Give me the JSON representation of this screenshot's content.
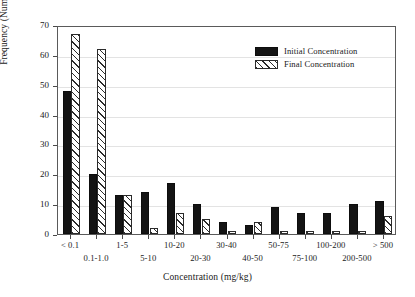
{
  "chart_data": {
    "type": "bar",
    "title": "",
    "subtitle": "",
    "xlabel": "Concentration (mg/kg)",
    "ylabel": "Frequency (Number of Samples)",
    "ylim": [
      0,
      70
    ],
    "ytick_step": 10,
    "yticks": [
      "0",
      "10",
      "20",
      "30",
      "40",
      "50",
      "60",
      "70"
    ],
    "grid": true,
    "grid_axis": "y",
    "legend_position": "upper right",
    "categories": [
      "< 0.1",
      "0.1-1.0",
      "1-5",
      "5-10",
      "10-20",
      "20-30",
      "30-40",
      "40-50",
      "50-75",
      "75-100",
      "100-200",
      "200-500",
      "> 500"
    ],
    "categories_used": [
      "< 0.1",
      "0.1-1.0",
      "1-5",
      "5-10",
      "10-20",
      "20-30",
      "30-40",
      "40-50",
      "50-75",
      "75-100",
      "100-200",
      "200-500",
      "> 500"
    ],
    "series": [
      {
        "name": "Initial Concentration",
        "style": "solid-black",
        "color": "#141414",
        "values": [
          48,
          20,
          13,
          14,
          17,
          10,
          4,
          3,
          9,
          7,
          7,
          10,
          11
        ]
      },
      {
        "name": "Final Concentration",
        "style": "hatched",
        "color": "#ffffff",
        "hatch": "diagonal",
        "values": [
          67,
          62,
          13,
          2,
          7,
          5,
          1,
          4,
          1,
          1,
          1,
          1,
          6
        ]
      }
    ]
  },
  "legend": {
    "entries": [
      {
        "label": "Initial Concentration",
        "swatch": "solid-black-swatch"
      },
      {
        "label": "Final Concentration",
        "swatch": "hatched-swatch"
      }
    ]
  },
  "axes": {
    "y_title": "Frequency (Number of Samples)",
    "x_title": "Concentration (mg/kg)"
  },
  "colors": {
    "initial": "#141414",
    "final": "#ffffff",
    "hatch": "#2b2b2b",
    "axis": "#5a5a5a",
    "grid": "#e3e3e3",
    "text": "#1a1a1a",
    "background": "#ffffff"
  }
}
